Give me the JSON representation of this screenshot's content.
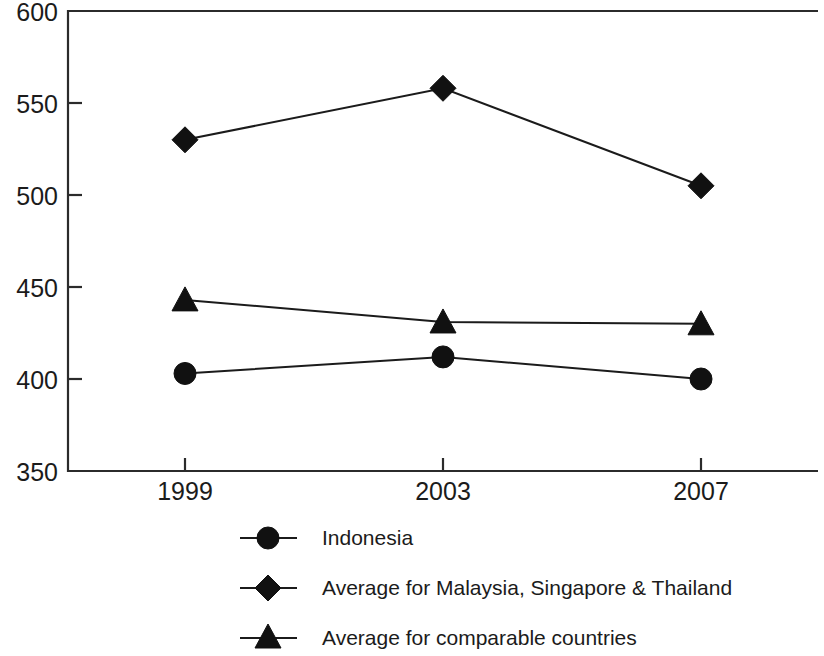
{
  "chart_data": {
    "type": "line",
    "title": "",
    "subtitle": "",
    "xlabel": "",
    "ylabel": "",
    "categories": [
      "1999",
      "2003",
      "2007"
    ],
    "x": [
      1999,
      2003,
      2007
    ],
    "xlim": [
      1997,
      2009
    ],
    "ylim": [
      350,
      600
    ],
    "ytick_labels": [
      "350",
      "400",
      "450",
      "500",
      "550",
      "600"
    ],
    "yticks": [
      350,
      400,
      450,
      500,
      550,
      600
    ],
    "xtick_labels": [
      "1999",
      "2003",
      "2007"
    ],
    "grid": false,
    "legend_position": "bottom",
    "series": [
      {
        "name": "Indonesia",
        "marker": "circle",
        "color": "#111111",
        "values": [
          403,
          412,
          400
        ]
      },
      {
        "name": "Average for Malaysia, Singapore & Thailand",
        "marker": "diamond",
        "color": "#111111",
        "values": [
          530,
          558,
          505
        ]
      },
      {
        "name": "Average for comparable countries",
        "marker": "triangle",
        "color": "#111111",
        "values": [
          443,
          431,
          430
        ]
      }
    ]
  },
  "legend": {
    "items": [
      {
        "label": "Indonesia",
        "marker": "circle-marker-icon"
      },
      {
        "label": "Average for Malaysia, Singapore & Thailand",
        "marker": "diamond-marker-icon"
      },
      {
        "label": "Average for comparable countries",
        "marker": "triangle-marker-icon"
      }
    ]
  },
  "axis": {
    "y_labels": [
      "600",
      "550",
      "500",
      "450",
      "400",
      "350"
    ],
    "x_labels": [
      "1999",
      "2003",
      "2007"
    ]
  }
}
